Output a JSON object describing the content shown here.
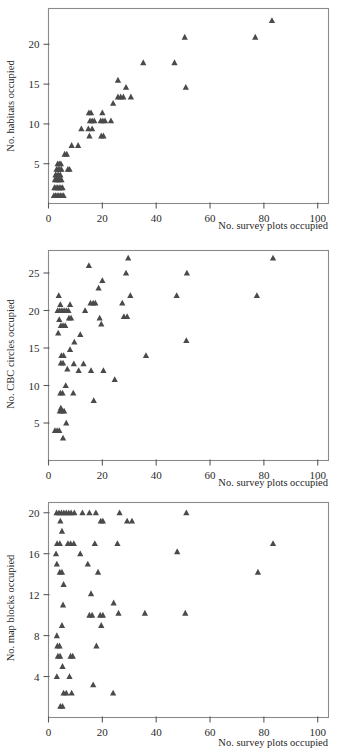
{
  "figure": {
    "marker_color": "#4a4a4a",
    "frame_color": "#8a8a8a",
    "axis_color": "#5a5a5a",
    "background": "#ffffff",
    "marker_shape": "triangle"
  },
  "panels": [
    {
      "id": "panel-1",
      "ylabel": "No. habitats occupied",
      "xlabel": "No. survey plots occupied"
    },
    {
      "id": "panel-2",
      "ylabel": "No. CBC circles occupied",
      "xlabel": "No. survey plots occupied"
    },
    {
      "id": "panel-3",
      "ylabel": "No. map blocks occupied",
      "xlabel": "No. survey plots occupied"
    }
  ],
  "chart_data": [
    {
      "type": "scatter",
      "title": "",
      "xlabel": "No. survey plots occupied",
      "ylabel": "No. habitats occupied",
      "xlim": [
        0,
        104
      ],
      "ylim": [
        0,
        24.5
      ],
      "xticks": [
        0,
        20,
        40,
        60,
        80,
        100
      ],
      "yticks": [
        5,
        10,
        15,
        20
      ],
      "grid": false,
      "legend": null,
      "marker": "triangle",
      "points": [
        [
          2,
          1
        ],
        [
          2.6,
          1
        ],
        [
          3.2,
          1
        ],
        [
          3.8,
          1
        ],
        [
          4.4,
          1
        ],
        [
          5,
          1
        ],
        [
          5.6,
          1
        ],
        [
          2.2,
          2
        ],
        [
          2.8,
          2
        ],
        [
          3.4,
          2
        ],
        [
          4,
          2
        ],
        [
          4.6,
          2
        ],
        [
          5.2,
          2
        ],
        [
          2.4,
          3
        ],
        [
          3,
          3
        ],
        [
          3.6,
          3
        ],
        [
          4.2,
          3
        ],
        [
          4.8,
          3
        ],
        [
          2.6,
          3.6
        ],
        [
          3.2,
          3.6
        ],
        [
          3.8,
          3.6
        ],
        [
          4.4,
          3.6
        ],
        [
          3,
          4.3
        ],
        [
          3.6,
          4.3
        ],
        [
          4.2,
          4.3
        ],
        [
          4.8,
          4.3
        ],
        [
          7.2,
          4.3
        ],
        [
          7.8,
          4.3
        ],
        [
          3.4,
          5
        ],
        [
          4,
          5
        ],
        [
          4.6,
          5
        ],
        [
          6,
          6.2
        ],
        [
          6.8,
          6.2
        ],
        [
          8.6,
          7.3
        ],
        [
          11,
          7.3
        ],
        [
          12.2,
          9.4
        ],
        [
          14.8,
          9.4
        ],
        [
          16.2,
          9.4
        ],
        [
          15.2,
          8.5
        ],
        [
          19.6,
          8.5
        ],
        [
          20.4,
          8.5
        ],
        [
          15.4,
          10.4
        ],
        [
          16.2,
          10.4
        ],
        [
          17,
          10.4
        ],
        [
          19.4,
          10.4
        ],
        [
          20.2,
          10.4
        ],
        [
          21,
          10.4
        ],
        [
          23.2,
          10.4
        ],
        [
          15,
          11.4
        ],
        [
          15.8,
          11.4
        ],
        [
          20,
          11.4
        ],
        [
          24,
          12.6
        ],
        [
          25.8,
          13.4
        ],
        [
          26.8,
          13.4
        ],
        [
          27.8,
          13.4
        ],
        [
          30.6,
          13.4
        ],
        [
          25.8,
          15.5
        ],
        [
          28.8,
          14.6
        ],
        [
          51,
          14.6
        ],
        [
          35.2,
          17.7
        ],
        [
          46.8,
          17.7
        ],
        [
          50.6,
          20.9
        ],
        [
          76.8,
          20.9
        ],
        [
          83,
          23
        ]
      ]
    },
    {
      "type": "scatter",
      "title": "",
      "xlabel": "No. survey plots occupied",
      "ylabel": "No. CBC circles occupied",
      "xlim": [
        0,
        104
      ],
      "ylim": [
        0,
        28
      ],
      "xticks": [
        0,
        20,
        40,
        60,
        80,
        100
      ],
      "yticks": [
        5,
        10,
        15,
        20,
        25
      ],
      "grid": false,
      "legend": null,
      "marker": "triangle",
      "points": [
        [
          2.4,
          4
        ],
        [
          3.2,
          4
        ],
        [
          4,
          4
        ],
        [
          5.4,
          3
        ],
        [
          6.6,
          5
        ],
        [
          4.2,
          6.6
        ],
        [
          5,
          6.6
        ],
        [
          5.8,
          6.6
        ],
        [
          4.6,
          7
        ],
        [
          4.4,
          9
        ],
        [
          5.2,
          9
        ],
        [
          9.2,
          9
        ],
        [
          6.4,
          10
        ],
        [
          11.2,
          12
        ],
        [
          15.8,
          12
        ],
        [
          20.4,
          12
        ],
        [
          24.6,
          10.8
        ],
        [
          7,
          12.2
        ],
        [
          9.4,
          12.9
        ],
        [
          13,
          12.9
        ],
        [
          4.6,
          13
        ],
        [
          5.4,
          13
        ],
        [
          4.8,
          14
        ],
        [
          5.6,
          14
        ],
        [
          8,
          14.8
        ],
        [
          9.6,
          15.8
        ],
        [
          11.8,
          16.8
        ],
        [
          3.6,
          17
        ],
        [
          4.6,
          18
        ],
        [
          5.4,
          18
        ],
        [
          6.2,
          18
        ],
        [
          4,
          18.8
        ],
        [
          19.6,
          18.2
        ],
        [
          19,
          19
        ],
        [
          28,
          19.2
        ],
        [
          29.2,
          19.2
        ],
        [
          7.6,
          19
        ],
        [
          8.4,
          19
        ],
        [
          3.4,
          20
        ],
        [
          4.2,
          20
        ],
        [
          5,
          20
        ],
        [
          5.8,
          20
        ],
        [
          6.6,
          20
        ],
        [
          7.4,
          20
        ],
        [
          13.6,
          20
        ],
        [
          4.4,
          20.8
        ],
        [
          8,
          20.8
        ],
        [
          15.6,
          21
        ],
        [
          16.6,
          21
        ],
        [
          17.4,
          21
        ],
        [
          27.4,
          21
        ],
        [
          3.8,
          22
        ],
        [
          30.4,
          22
        ],
        [
          47.6,
          22
        ],
        [
          77.4,
          22
        ],
        [
          18.6,
          23
        ],
        [
          20,
          24
        ],
        [
          28.8,
          25
        ],
        [
          51.4,
          25
        ],
        [
          15,
          26
        ],
        [
          29.6,
          27
        ],
        [
          83.4,
          27
        ],
        [
          16.8,
          8
        ],
        [
          51.2,
          16
        ],
        [
          36.2,
          14
        ]
      ]
    },
    {
      "type": "scatter",
      "title": "",
      "xlabel": "No. survey plots occupied",
      "ylabel": "No. map blocks occupied",
      "xlim": [
        0,
        104
      ],
      "ylim": [
        0,
        21
      ],
      "xticks": [
        0,
        20,
        40,
        60,
        80,
        100
      ],
      "yticks": [
        4,
        8,
        12,
        16,
        20
      ],
      "grid": false,
      "legend": null,
      "marker": "triangle",
      "points": [
        [
          3,
          20
        ],
        [
          3.9,
          20
        ],
        [
          4.8,
          20
        ],
        [
          5.7,
          20
        ],
        [
          6.6,
          20
        ],
        [
          7.5,
          20
        ],
        [
          8.4,
          20
        ],
        [
          9.6,
          20
        ],
        [
          12.6,
          20
        ],
        [
          15.2,
          20
        ],
        [
          17.6,
          20
        ],
        [
          26.4,
          20
        ],
        [
          51.2,
          20
        ],
        [
          4.4,
          19.2
        ],
        [
          19.4,
          19.2
        ],
        [
          20.2,
          19.2
        ],
        [
          29.2,
          19.2
        ],
        [
          31,
          19.2
        ],
        [
          5,
          18.2
        ],
        [
          3.2,
          17
        ],
        [
          4.2,
          17
        ],
        [
          7.2,
          17
        ],
        [
          8.2,
          17
        ],
        [
          9.4,
          17
        ],
        [
          17.2,
          17
        ],
        [
          25.6,
          17
        ],
        [
          83.4,
          17
        ],
        [
          2.8,
          16
        ],
        [
          11.8,
          16
        ],
        [
          47.8,
          16.2
        ],
        [
          3.1,
          15
        ],
        [
          14.6,
          15
        ],
        [
          4.2,
          14.2
        ],
        [
          5,
          14.2
        ],
        [
          18.4,
          14.2
        ],
        [
          77.8,
          14.2
        ],
        [
          5.6,
          13
        ],
        [
          15.8,
          12.1
        ],
        [
          5.4,
          11
        ],
        [
          24.2,
          11.2
        ],
        [
          5,
          9
        ],
        [
          19.6,
          9
        ],
        [
          15.2,
          10
        ],
        [
          16.2,
          10
        ],
        [
          19.2,
          10
        ],
        [
          20.2,
          10
        ],
        [
          26,
          10.2
        ],
        [
          35.8,
          10.2
        ],
        [
          50.8,
          10.2
        ],
        [
          3.1,
          8
        ],
        [
          3.3,
          7
        ],
        [
          4.1,
          7
        ],
        [
          17.8,
          7
        ],
        [
          3.5,
          6
        ],
        [
          4.3,
          6
        ],
        [
          8.2,
          6
        ],
        [
          9,
          6
        ],
        [
          5.2,
          5
        ],
        [
          3.1,
          4
        ],
        [
          7.8,
          4
        ],
        [
          5.6,
          2.4
        ],
        [
          6.6,
          2.4
        ],
        [
          8.6,
          2.4
        ],
        [
          24,
          2.4
        ],
        [
          16.6,
          3.2
        ],
        [
          4.4,
          1.1
        ],
        [
          5.2,
          1.1
        ]
      ]
    }
  ]
}
